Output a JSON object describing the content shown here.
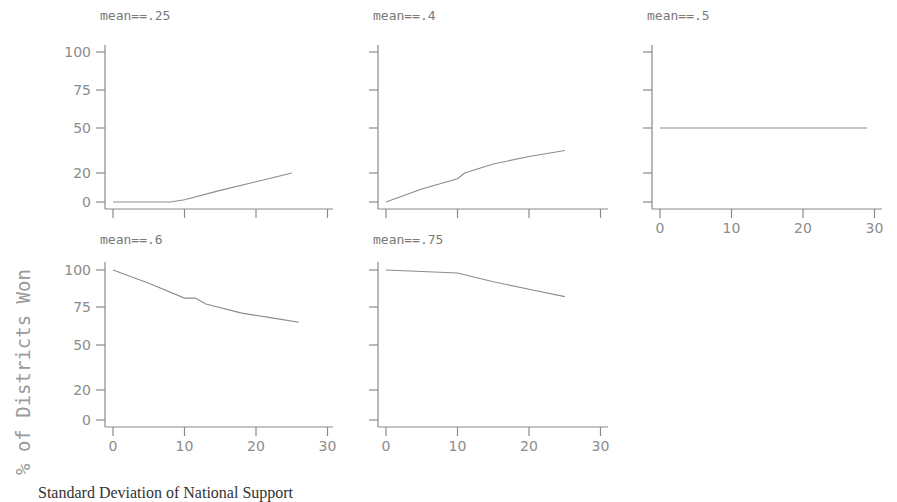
{
  "chart_data": {
    "type": "line",
    "layout": "small-multiples 2x3 (5 panels)",
    "ylabel": "% of Districts Won",
    "xlabel": "Standard Deviation of National Support",
    "grid": false,
    "legend": null,
    "xlim": [
      0,
      30
    ],
    "ylim": [
      0,
      100
    ],
    "x_ticks": [
      "0",
      "10",
      "20",
      "30"
    ],
    "y_ticks": [
      "0",
      "20",
      "50",
      "75",
      "100"
    ],
    "panels": [
      {
        "title": "mean==.25",
        "x": [
          0,
          5,
          8,
          10,
          15,
          20,
          25
        ],
        "y": [
          0,
          0,
          0,
          1.5,
          8,
          14,
          20
        ]
      },
      {
        "title": "mean==.4",
        "x": [
          0,
          5,
          10,
          11,
          15,
          20,
          25
        ],
        "y": [
          0,
          9,
          16,
          20,
          26,
          31,
          35
        ]
      },
      {
        "title": "mean==.5",
        "x": [
          0,
          10,
          20,
          29
        ],
        "y": [
          50,
          50,
          50,
          50
        ]
      },
      {
        "title": "mean==.6",
        "x": [
          0,
          5,
          10,
          11.5,
          13,
          18,
          22,
          26
        ],
        "y": [
          100,
          91,
          81,
          81,
          77,
          71,
          68,
          65
        ]
      },
      {
        "title": "mean==.75",
        "x": [
          0,
          10,
          15,
          20,
          25
        ],
        "y": [
          100,
          98,
          92,
          87,
          82
        ]
      }
    ]
  },
  "labels": {
    "ylabel": "% of Districts Won",
    "xlabel": "Standard Deviation of National Support",
    "panel_titles": [
      "mean==.25",
      "mean==.4",
      "mean==.5",
      "mean==.6",
      "mean==.75"
    ],
    "x_ticks": [
      "0",
      "10",
      "20",
      "30"
    ],
    "y_ticks": [
      "100",
      "75",
      "50",
      "20",
      "0"
    ]
  }
}
